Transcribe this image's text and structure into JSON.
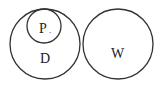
{
  "diagram": {
    "type": "euler",
    "stroke_color": "#333333",
    "sets": [
      {
        "id": "D",
        "label": "D",
        "cx": 45,
        "cy": 44,
        "r": 35
      },
      {
        "id": "P",
        "label": "P",
        "cx": 44,
        "cy": 26,
        "r": 17,
        "inside": "D"
      },
      {
        "id": "W",
        "label": "W",
        "cx": 118,
        "cy": 44,
        "r": 35
      }
    ],
    "annotations": {
      "p_dot": "."
    }
  }
}
